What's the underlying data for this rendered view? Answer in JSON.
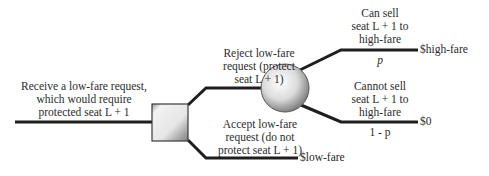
{
  "diagram": {
    "type": "decision-tree",
    "root": {
      "label_lines": [
        "Receive a low-fare request,",
        "which would  require",
        "protected seat L + 1"
      ]
    },
    "decision_node": {
      "shape": "square"
    },
    "chance_node": {
      "shape": "circle"
    },
    "branches": {
      "reject": {
        "label_lines": [
          "Reject low-fare",
          "request (protect",
          "seat L + 1)"
        ]
      },
      "accept": {
        "label_lines": [
          "Accept low-fare",
          "request (do not",
          "protect seat L + 1)"
        ],
        "payoff": "$low-fare"
      },
      "can_sell": {
        "label_lines": [
          "Can sell",
          "seat L + 1 to",
          "high-fare"
        ],
        "probability": "p",
        "payoff": "$high-fare"
      },
      "cannot_sell": {
        "label_lines": [
          "Cannot sell",
          "seat L + 1 to",
          "high-fare"
        ],
        "probability": "1 - p",
        "payoff": "$0"
      }
    },
    "colors": {
      "line": "#1e1e1e",
      "node_fill_light": "#f4f4f4",
      "node_fill_dark": "#8a8a8a"
    }
  }
}
